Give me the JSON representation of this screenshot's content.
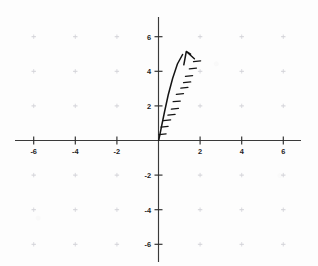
{
  "figure": {
    "background_color": "#fdfdfd",
    "ink_color": "#141414",
    "axis_color": "#3a3a3a",
    "grid_color": "#c9c9cf",
    "width": 318,
    "height": 266
  },
  "chart_data": {
    "type": "scatter",
    "title": "",
    "subtitle": "",
    "xlabel": "",
    "ylabel": "",
    "xlim": [
      -6.8,
      6.8
    ],
    "ylim": [
      -7.1,
      7.1
    ],
    "grid": true,
    "grid_style": "faint dotted lattice marks at even coordinates",
    "legend": false,
    "legend_position": "none",
    "xticks": [
      -6,
      -4,
      -2,
      2,
      4,
      6
    ],
    "yticks": [
      -6,
      -4,
      -2,
      2,
      4,
      6
    ],
    "xtick_labels": [
      "-6",
      "-4",
      "-2",
      "2",
      "4",
      "6"
    ],
    "ytick_labels": [
      "-6",
      "-4",
      "-2",
      "2",
      "4",
      "6"
    ],
    "origin_label": "",
    "annotations": [
      {
        "name": "vector-arrow",
        "kind": "vector",
        "start": [
          0,
          0
        ],
        "end": [
          2,
          5
        ],
        "style": "hand-drawn arrow with hatch marks along shaft",
        "hatch_count": 12,
        "label": ""
      }
    ],
    "series": [
      {
        "name": "vector",
        "x": [
          0,
          2
        ],
        "y": [
          0,
          5
        ]
      }
    ]
  },
  "axes": {
    "x_axis_name": "x-axis",
    "y_axis_name": "y-axis",
    "x_labels": [
      {
        "text": "-6",
        "value": -6
      },
      {
        "text": "-4",
        "value": -4
      },
      {
        "text": "-2",
        "value": -2
      },
      {
        "text": "2",
        "value": 2
      },
      {
        "text": "4",
        "value": 4
      },
      {
        "text": "6",
        "value": 6
      }
    ],
    "y_labels": [
      {
        "text": "6",
        "value": 6
      },
      {
        "text": "4",
        "value": 4
      },
      {
        "text": "2",
        "value": 2
      },
      {
        "text": "-2",
        "value": -2
      },
      {
        "text": "-4",
        "value": -4
      },
      {
        "text": "-6",
        "value": -6
      }
    ]
  }
}
